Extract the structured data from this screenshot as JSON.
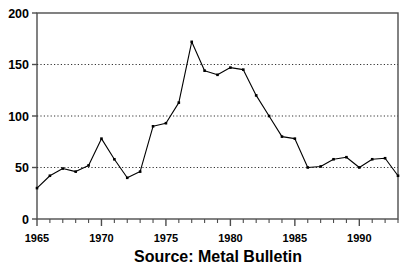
{
  "chart_data": {
    "type": "line",
    "title": "",
    "subtitle": "",
    "caption": "Source: Metal Bulletin",
    "xlabel": "",
    "ylabel": "",
    "xlim": [
      1965,
      1993
    ],
    "ylim": [
      0,
      200
    ],
    "grid": "horizontal-dotted",
    "gridlines_y": [
      50,
      100,
      150
    ],
    "legend": "none",
    "y_ticks": [
      0,
      50,
      100,
      150,
      200
    ],
    "y_tick_labels": [
      "0",
      "50",
      "100",
      "150",
      "200"
    ],
    "x_ticks_major": [
      1965,
      1970,
      1975,
      1980,
      1985,
      1990
    ],
    "x_tick_labels": [
      "1965",
      "1970",
      "1975",
      "1980",
      "1985",
      "1990"
    ],
    "x_minor_tick_interval": 1,
    "markers": "small filled squares",
    "line_color": "#000000",
    "x": [
      1965,
      1966,
      1967,
      1968,
      1969,
      1970,
      1971,
      1972,
      1973,
      1974,
      1975,
      1976,
      1977,
      1978,
      1979,
      1980,
      1981,
      1982,
      1983,
      1984,
      1985,
      1986,
      1987,
      1988,
      1989,
      1990,
      1991,
      1992,
      1993
    ],
    "values": [
      30,
      42,
      49,
      46,
      52,
      78,
      58,
      40,
      46,
      90,
      93,
      113,
      172,
      144,
      140,
      147,
      145,
      120,
      100,
      80,
      78,
      50,
      51,
      58,
      60,
      50,
      58,
      59,
      42
    ],
    "series": [
      {
        "name": "price",
        "values": [
          30,
          42,
          49,
          46,
          52,
          78,
          58,
          40,
          46,
          90,
          93,
          113,
          172,
          144,
          140,
          147,
          145,
          120,
          100,
          80,
          78,
          50,
          51,
          58,
          60,
          50,
          58,
          59,
          42
        ]
      }
    ]
  },
  "colors": {
    "background": "#ffffff",
    "axis": "#4d4d4d",
    "line": "#000000",
    "grid": "#333333"
  },
  "plot": {
    "left": 37,
    "right": 398,
    "top": 13,
    "bottom": 219
  }
}
